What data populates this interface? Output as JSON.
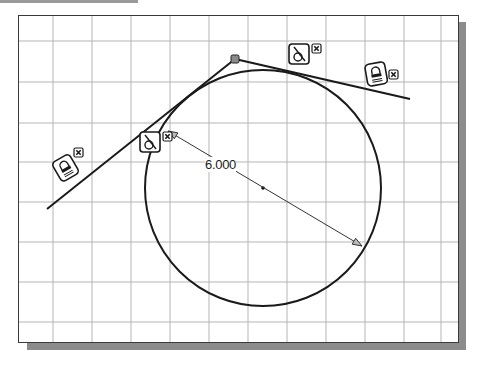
{
  "sketch": {
    "title": "Circle tangent to two lines sketch",
    "grid": {
      "columns_x": [
        53,
        92,
        131,
        170,
        209,
        248,
        287,
        326,
        365,
        404,
        441
      ],
      "rows_y": [
        41,
        82,
        123,
        162,
        202,
        242,
        282,
        322
      ],
      "grid_color": "#b5b5b5",
      "frame_color": "#3a3a3a",
      "shadow_color": "#8c8c8c"
    },
    "circle": {
      "cx": 263,
      "cy": 188,
      "r": 118
    },
    "lines": [
      {
        "name": "left-tangent-line",
        "x1": 47,
        "y1": 209,
        "x2": 235,
        "y2": 59
      },
      {
        "name": "right-tangent-line",
        "x1": 235,
        "y1": 59,
        "x2": 410,
        "y2": 99
      }
    ],
    "vertex": {
      "x": 235,
      "y": 59
    },
    "dimension": {
      "type": "diameter",
      "value": "6.000",
      "x1": 168,
      "y1": 131,
      "x2": 362,
      "y2": 246,
      "label_x": 205,
      "label_y": 157
    },
    "constraints": [
      {
        "type": "tangent",
        "icon": "tangent-constraint-icon",
        "x": 140,
        "y": 132,
        "delete_x": 163,
        "delete_y": 132
      },
      {
        "type": "tangent",
        "icon": "tangent-constraint-icon",
        "x": 289,
        "y": 44,
        "delete_x": 312,
        "delete_y": 44
      },
      {
        "type": "fix",
        "icon": "lock-constraint-icon",
        "x": 366,
        "y": 63,
        "delete_x": 389,
        "delete_y": 70
      },
      {
        "type": "fix",
        "icon": "lock-constraint-icon",
        "x": 55,
        "y": 157,
        "delete_x": 74,
        "delete_y": 148
      }
    ]
  }
}
